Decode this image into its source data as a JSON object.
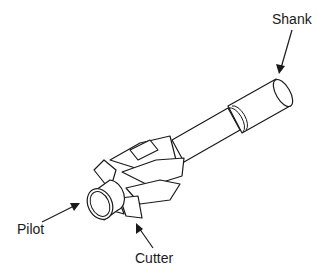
{
  "diagram": {
    "labels": {
      "shank": "Shank",
      "pilot": "Pilot",
      "cutter": "Cutter"
    },
    "colors": {
      "line": "#1a1a1a",
      "background": "#ffffff"
    }
  }
}
